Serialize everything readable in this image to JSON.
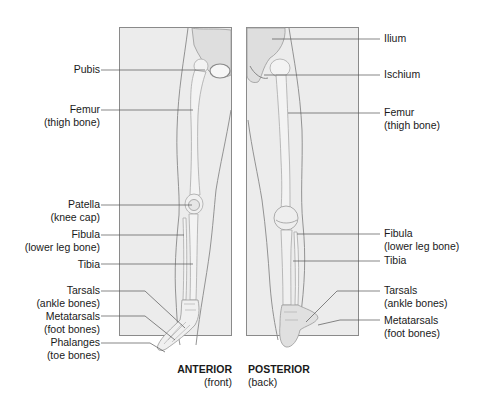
{
  "diagram": {
    "colors": {
      "panel_fill": "#ececec",
      "panel_border": "#8a8a8a",
      "bone": "#f3f3f3",
      "bone_shade": "#bdbdbd",
      "leader_line": "#555555",
      "text": "#1a1a1a"
    },
    "anterior": {
      "title": "ANTERIOR",
      "subtitle": "(front)",
      "labels": [
        {
          "name": "Pubis",
          "sub": ""
        },
        {
          "name": "Femur",
          "sub": "(thigh bone)"
        },
        {
          "name": "Patella",
          "sub": "(knee cap)"
        },
        {
          "name": "Fibula",
          "sub": "(lower leg bone)"
        },
        {
          "name": "Tibia",
          "sub": ""
        },
        {
          "name": "Tarsals",
          "sub": "(ankle bones)"
        },
        {
          "name": "Metatarsals",
          "sub": "(foot bones)"
        },
        {
          "name": "Phalanges",
          "sub": "(toe bones)"
        }
      ]
    },
    "posterior": {
      "title": "POSTERIOR",
      "subtitle": "(back)",
      "labels": [
        {
          "name": "Ilium",
          "sub": ""
        },
        {
          "name": "Ischium",
          "sub": ""
        },
        {
          "name": "Femur",
          "sub": "(thigh bone)"
        },
        {
          "name": "Fibula",
          "sub": "(lower leg bone)"
        },
        {
          "name": "Tibia",
          "sub": ""
        },
        {
          "name": "Tarsals",
          "sub": "(ankle bones)"
        },
        {
          "name": "Metatarsals",
          "sub": "(foot bones)"
        }
      ]
    }
  }
}
